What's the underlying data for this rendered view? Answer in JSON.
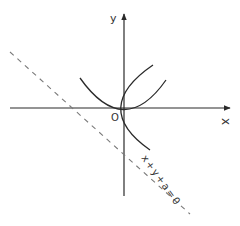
{
  "figure": {
    "type": "coordinate-diagram",
    "axes": {
      "x_label": "x",
      "y_label": "y",
      "origin_label": "O"
    },
    "curves": [
      {
        "name": "parabola-upward",
        "equation_shape": "y = kx^2"
      },
      {
        "name": "parabola-rightward",
        "equation_shape": "x = ky^2"
      }
    ],
    "line": {
      "label": "x+y+a=0",
      "style": "dashed"
    },
    "colors": {
      "stroke": "#2a2a2a",
      "dashed": "#7a7a7a",
      "text": "#333333"
    }
  }
}
